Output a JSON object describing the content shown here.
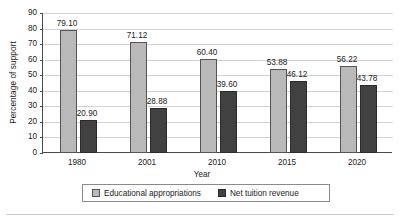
{
  "chart_data": {
    "type": "bar",
    "title": "",
    "xlabel": "Year",
    "ylabel": "Percentage of support",
    "categories": [
      "1980",
      "2001",
      "2010",
      "2015",
      "2020"
    ],
    "series": [
      {
        "name": "Educational appropriations",
        "color": "#b9b9b9",
        "values": [
          79.1,
          71.12,
          60.4,
          53.88,
          56.22
        ],
        "labels": [
          "79.10",
          "71.12",
          "60.40",
          "53.88",
          "56.22"
        ]
      },
      {
        "name": "Net tuition revenue",
        "color": "#414141",
        "values": [
          20.9,
          28.88,
          39.6,
          46.12,
          43.78
        ],
        "labels": [
          "20.90",
          "28.88",
          "39.60",
          "46.12",
          "43.78"
        ]
      }
    ],
    "ylim": [
      0,
      90
    ],
    "yticks": [
      0,
      10,
      20,
      30,
      40,
      50,
      60,
      70,
      80,
      90
    ],
    "ytick_labels": [
      "0",
      "10",
      "20",
      "30",
      "40",
      "50",
      "60",
      "70",
      "80",
      "90"
    ],
    "grid": "horizontal",
    "legend_position": "bottom",
    "data_labels": true
  },
  "legend": {
    "entries": [
      {
        "label": "Educational appropriations"
      },
      {
        "label": "Net tuition revenue"
      }
    ]
  },
  "axes": {
    "x_title": "Year",
    "y_title": "Percentage of support"
  }
}
